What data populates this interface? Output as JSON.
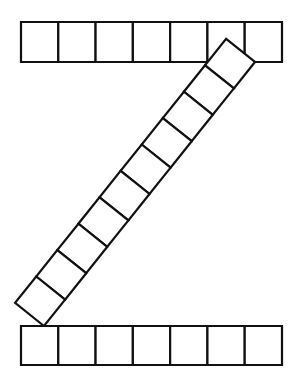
{
  "figure": {
    "name": "z-shaped-square-strip-puzzle",
    "background_color": "#ffffff",
    "line_color": "#111111",
    "fill_color": "#ffffff",
    "line_width": 2.2,
    "canvas": {
      "width": 295,
      "height": 379
    }
  },
  "strips": [
    {
      "id": "top-strip",
      "label": "top-strip",
      "orientation": "horizontal",
      "cell_count": 7,
      "x_start": 21,
      "y_start": 22,
      "x_end": 282,
      "y_end": 62,
      "cell_width": 37.28,
      "cell_height": 40
    },
    {
      "id": "diagonal-strip",
      "label": "diagonal-strip",
      "orientation": "diagonal",
      "cell_count": 10,
      "start_point": {
        "x": 255,
        "y": 62
      },
      "end_point": {
        "x": 44,
        "y": 326
      },
      "strip_width": 37,
      "angle_degrees": 51.4
    },
    {
      "id": "bottom-strip",
      "label": "bottom-strip",
      "orientation": "horizontal",
      "cell_count": 7,
      "x_start": 21,
      "y_start": 326,
      "x_end": 282,
      "y_end": 365,
      "cell_width": 37.28,
      "cell_height": 39
    }
  ],
  "totals": {
    "total_squares": 24,
    "top_squares": 7,
    "diagonal_squares": 10,
    "bottom_squares": 7
  }
}
